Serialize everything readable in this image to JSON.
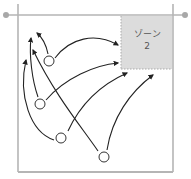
{
  "diagram": {
    "zone": {
      "label_line1": "ゾーン",
      "label_line2": "2",
      "fill": "#dcdcdc",
      "border": "#aaaaaa"
    },
    "colors": {
      "frame": "#b5b5b5",
      "arrow": "#222222",
      "player_fill": "#ffffff",
      "player_stroke": "#333333",
      "endpoint_dot": "#a8a8a8"
    },
    "players": [
      {
        "id": "p1",
        "x": 49,
        "y": 61
      },
      {
        "id": "p2",
        "x": 40,
        "y": 104
      },
      {
        "id": "p3",
        "x": 61,
        "y": 138
      },
      {
        "id": "p4",
        "x": 104,
        "y": 157
      }
    ]
  }
}
